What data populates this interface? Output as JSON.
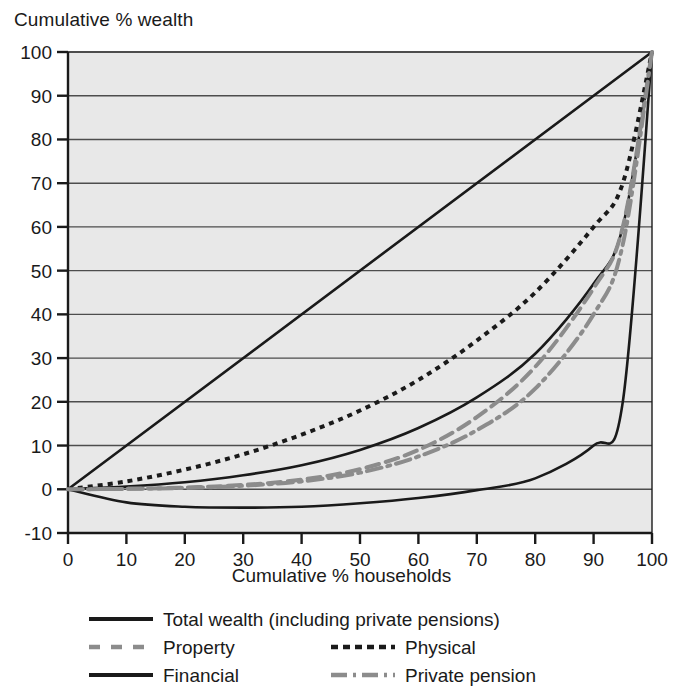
{
  "chart_data": {
    "type": "line",
    "title": "",
    "ylabel": "Cumulative % wealth",
    "xlabel": "Cumulative % households",
    "xlim": [
      0,
      100
    ],
    "ylim": [
      -10,
      100
    ],
    "xticks": [
      "0",
      "10",
      "20",
      "30",
      "40",
      "50",
      "60",
      "70",
      "80",
      "90",
      "100"
    ],
    "yticks": [
      "-10",
      "0",
      "10",
      "20",
      "30",
      "40",
      "50",
      "60",
      "70",
      "80",
      "90",
      "100"
    ],
    "grid": "horizontal",
    "legend_position": "below-plot",
    "x": [
      0,
      10,
      20,
      30,
      40,
      50,
      60,
      70,
      80,
      90,
      95,
      100
    ],
    "series": [
      {
        "name": "line-of-equality",
        "label": "",
        "style": "solid",
        "color": "#1a1a1a",
        "values": [
          0,
          10,
          20,
          30,
          40,
          50,
          60,
          70,
          80,
          90,
          95,
          100
        ]
      },
      {
        "name": "total-wealth",
        "label": "Total wealth (including private pensions)",
        "style": "solid",
        "color": "#1a1a1a",
        "values": [
          0,
          0.6,
          1.6,
          3.2,
          5.5,
          9.0,
          14.0,
          21.0,
          31.0,
          47.0,
          60.0,
          100
        ]
      },
      {
        "name": "property",
        "label": "Property",
        "style": "dashed",
        "color": "#8c8c8c",
        "values": [
          0,
          0.1,
          0.4,
          1.0,
          2.2,
          4.6,
          9.0,
          16.5,
          28.0,
          46.0,
          60.0,
          100
        ]
      },
      {
        "name": "physical",
        "label": "Physical",
        "style": "dotted",
        "color": "#1a1a1a",
        "values": [
          0,
          1.8,
          4.5,
          8.0,
          12.5,
          18.0,
          25.0,
          34.0,
          45.0,
          60.0,
          70.0,
          100
        ]
      },
      {
        "name": "financial",
        "label": "Financial",
        "style": "solid",
        "color": "#1a1a1a",
        "values": [
          0,
          -3.0,
          -4.0,
          -4.2,
          -4.0,
          -3.2,
          -2.0,
          -0.2,
          2.5,
          10.0,
          20.0,
          100
        ]
      },
      {
        "name": "private-pension",
        "label": "Private pension",
        "style": "dashdot",
        "color": "#8c8c8c",
        "values": [
          0,
          0.1,
          0.3,
          0.8,
          1.8,
          3.8,
          7.5,
          13.5,
          23.0,
          40.0,
          56.0,
          100
        ]
      }
    ]
  },
  "legend": {
    "items": [
      {
        "name": "total-wealth",
        "label": "Total wealth (including private pensions)",
        "style": "solid",
        "color": "#1a1a1a"
      },
      {
        "name": "property",
        "label": "Property",
        "style": "dashed",
        "color": "#8c8c8c"
      },
      {
        "name": "financial",
        "label": "Financial",
        "style": "solid",
        "color": "#1a1a1a"
      },
      {
        "name": "physical",
        "label": "Physical",
        "style": "dotted",
        "color": "#1a1a1a"
      },
      {
        "name": "private-pension",
        "label": "Private pension",
        "style": "dashdot",
        "color": "#8c8c8c"
      }
    ]
  },
  "colors": {
    "plot_background": "#e8e8e8",
    "gridline": "#4d4d4d",
    "axis": "#1a1a1a",
    "text": "#1a1a1a",
    "series_black": "#1a1a1a",
    "series_gray": "#8c8c8c"
  }
}
